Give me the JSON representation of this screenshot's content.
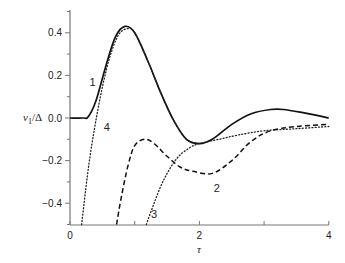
{
  "chart_data": {
    "type": "line",
    "title": "",
    "xlabel": "τ",
    "ylabel": "v1/Δ",
    "xlim": [
      0,
      4
    ],
    "ylim": [
      -0.5,
      0.5
    ],
    "xticks": [
      0,
      1,
      2,
      3,
      4
    ],
    "xtick_labels": [
      "0",
      "",
      "2",
      "",
      "4"
    ],
    "yticks": [
      -0.4,
      -0.2,
      0.0,
      0.2,
      0.4
    ],
    "ytick_labels": [
      "−0.4",
      "−0.2",
      "0.0",
      "0.2",
      "0.4"
    ],
    "grid": false,
    "legend": "none (curves labeled inline 1–4)",
    "series": [
      {
        "name": "1",
        "style": "solid",
        "x": [
          0,
          0.2,
          0.28,
          0.4,
          0.55,
          0.7,
          0.85,
          1.0,
          1.2,
          1.4,
          1.6,
          1.8,
          2.0,
          2.2,
          2.5,
          2.8,
          3.1,
          3.3,
          3.6,
          4.0
        ],
        "y": [
          0,
          0,
          0.005,
          0.08,
          0.24,
          0.38,
          0.43,
          0.4,
          0.27,
          0.12,
          -0.01,
          -0.1,
          -0.12,
          -0.1,
          -0.03,
          0.02,
          0.04,
          0.04,
          0.025,
          0.0
        ]
      },
      {
        "name": "2",
        "style": "dashed",
        "x": [
          0.72,
          0.8,
          0.9,
          1.0,
          1.15,
          1.3,
          1.5,
          1.7,
          1.9,
          2.2,
          2.5,
          2.8,
          3.1,
          3.5,
          4.0
        ],
        "y": [
          -0.5,
          -0.36,
          -0.22,
          -0.13,
          -0.1,
          -0.12,
          -0.18,
          -0.23,
          -0.25,
          -0.26,
          -0.2,
          -0.11,
          -0.06,
          -0.04,
          -0.03
        ]
      },
      {
        "name": "3",
        "style": "dotted",
        "x": [
          1.18,
          1.3,
          1.45,
          1.65,
          1.85,
          2.0,
          2.3,
          2.6,
          3.0,
          3.5,
          4.0
        ],
        "y": [
          -0.5,
          -0.4,
          -0.29,
          -0.19,
          -0.14,
          -0.12,
          -0.1,
          -0.08,
          -0.06,
          -0.05,
          -0.04
        ]
      },
      {
        "name": "4",
        "style": "dotted",
        "x": [
          0.18,
          0.3,
          0.45,
          0.6,
          0.75,
          0.9,
          1.0,
          1.2,
          1.4,
          1.6,
          1.8,
          2.0
        ],
        "y": [
          -0.5,
          -0.2,
          0.07,
          0.27,
          0.39,
          0.42,
          0.4,
          0.27,
          0.12,
          -0.01,
          -0.1,
          -0.12
        ]
      }
    ],
    "annotations": [
      {
        "text": "1",
        "x": 0.35,
        "y": 0.17
      },
      {
        "text": "4",
        "x": 0.57,
        "y": -0.04
      },
      {
        "text": "2",
        "x": 2.27,
        "y": -0.33
      },
      {
        "text": "3",
        "x": 1.3,
        "y": -0.45
      }
    ]
  },
  "labels": {
    "ylabel_main": "v",
    "ylabel_sub": "1",
    "ylabel_rest": "/Δ",
    "xlabel": "τ"
  }
}
